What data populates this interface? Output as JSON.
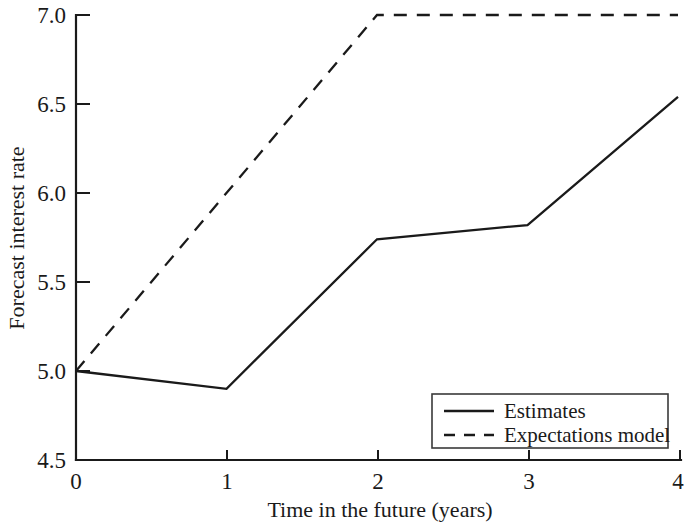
{
  "chart_data": {
    "type": "line",
    "title": "",
    "xlabel": "Time in the future (years)",
    "ylabel": "Forecast interest rate",
    "x": [
      0,
      1,
      2,
      3,
      4
    ],
    "xlim": [
      0,
      4
    ],
    "ylim": [
      4.5,
      7.0
    ],
    "xticks": [
      "0",
      "1",
      "2",
      "3",
      "4"
    ],
    "yticks": [
      "4.5",
      "5.0",
      "5.5",
      "6.0",
      "6.5",
      "7.0"
    ],
    "grid": false,
    "legend_position": "lower right",
    "series": [
      {
        "name": "Estimates",
        "style": "solid",
        "color": "#1a1a1a",
        "x": [
          0,
          1,
          2,
          3,
          4
        ],
        "values": [
          5.0,
          4.9,
          5.74,
          5.82,
          6.54
        ]
      },
      {
        "name": "Expectations model",
        "style": "dashed",
        "color": "#1a1a1a",
        "x": [
          0,
          2,
          4
        ],
        "values": [
          5.0,
          7.0,
          7.0
        ]
      }
    ]
  },
  "axes": {
    "y_title": "Forecast interest rate",
    "x_title": "Time in the future (years)",
    "y_tick_labels": [
      "7.0",
      "6.5",
      "6.0",
      "5.5",
      "5.0",
      "4.5"
    ],
    "x_tick_labels": [
      "0",
      "1",
      "2",
      "3",
      "4"
    ]
  },
  "legend": {
    "items": [
      {
        "label": "Estimates",
        "style": "solid"
      },
      {
        "label": "Expectations model",
        "style": "dashed"
      }
    ]
  }
}
